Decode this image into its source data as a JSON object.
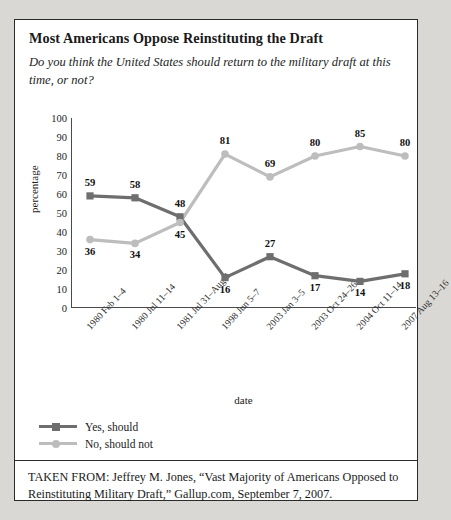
{
  "title": "Most Americans Oppose Reinstituting the Draft",
  "subtitle": "Do you think the United States should return to the military draft at this time, or not?",
  "source": "TAKEN FROM: Jeffrey M. Jones, “Vast Majority of Americans Opposed to Reinstituting Military Draft,” Gallup.com, September 7, 2007.",
  "colors": {
    "yes": "#6e6e6e",
    "no": "#bdbdbd",
    "axis": "#4a4a4a",
    "text": "#1a1a1a",
    "page_bg": "#d9d8d4",
    "card_bg": "#ffffff"
  },
  "legend": [
    {
      "label": "Yes, should",
      "marker": "square",
      "color": "#6e6e6e"
    },
    {
      "label": "No, should not",
      "marker": "circle",
      "color": "#bdbdbd"
    }
  ],
  "chart_data": {
    "type": "line",
    "title": "Most Americans Oppose Reinstituting the Draft",
    "xlabel": "date",
    "ylabel": "percentage",
    "ylim": [
      0,
      100
    ],
    "yticks": [
      100,
      90,
      80,
      70,
      60,
      50,
      40,
      30,
      20,
      10,
      0
    ],
    "grid": false,
    "legend_position": "below-left",
    "categories": [
      "1980 Feb 1–4",
      "1980 Jul 11–14",
      "1981 Jul 31–Aug 3",
      "1998 Jun 5–7",
      "2003 Jan 3–5",
      "2003 Oct 24–26",
      "2004 Oct 11–14",
      "2007 Aug 13–16"
    ],
    "series": [
      {
        "name": "Yes, should",
        "color": "#6e6e6e",
        "marker": "square",
        "values": [
          59,
          58,
          48,
          16,
          27,
          17,
          14,
          18
        ]
      },
      {
        "name": "No, should not",
        "color": "#bdbdbd",
        "marker": "circle",
        "values": [
          36,
          34,
          45,
          81,
          69,
          80,
          85,
          80
        ]
      }
    ]
  }
}
